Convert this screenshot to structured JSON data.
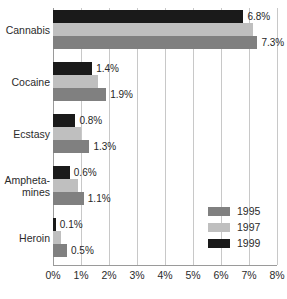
{
  "chart_data": {
    "type": "bar",
    "orientation": "horizontal",
    "title": "",
    "xlabel": "",
    "ylabel": "",
    "categories": [
      "Cannabis",
      "Cocaine",
      "Ecstasy",
      "Ampheta-\nmines",
      "Heroin"
    ],
    "xlim": [
      0,
      8
    ],
    "xticks": [
      0,
      1,
      2,
      3,
      4,
      5,
      6,
      7,
      8
    ],
    "xticklabels": [
      "0%",
      "1%",
      "2%",
      "3%",
      "4%",
      "5%",
      "6%",
      "7%",
      "8%"
    ],
    "grid": true,
    "legend_position": "center-right",
    "series": [
      {
        "name": "1999",
        "color": "#1a1a1a",
        "values": [
          6.8,
          1.4,
          0.8,
          0.6,
          0.1
        ],
        "labels": [
          "6.8%",
          "1.4%",
          "0.8%",
          "0.6%",
          "0.1%"
        ]
      },
      {
        "name": "1997",
        "color": "#bfbfbf",
        "values": [
          7.15,
          1.6,
          1.0,
          0.9,
          0.3
        ],
        "labels": [
          "",
          "",
          "",
          "",
          ""
        ]
      },
      {
        "name": "1995",
        "color": "#808080",
        "values": [
          7.3,
          1.9,
          1.3,
          1.1,
          0.5
        ],
        "labels": [
          "7.3%",
          "1.9%",
          "1.3%",
          "1.1%",
          "0.5%"
        ]
      }
    ]
  },
  "legend": {
    "items": [
      {
        "label": "1995",
        "color": "#808080"
      },
      {
        "label": "1997",
        "color": "#bfbfbf"
      },
      {
        "label": "1999",
        "color": "#1a1a1a"
      }
    ]
  }
}
